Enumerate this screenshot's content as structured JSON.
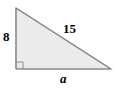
{
  "figure": {
    "kind": "right-triangle-diagram",
    "shape_name": "right triangle",
    "fill_color": "#ebebeb",
    "stroke_color": "#8c8c8c",
    "background_color": "#ffffff",
    "label_color": "#000000",
    "vertices": {
      "top_left": [
        16,
        8
      ],
      "bottom_left": [
        16,
        69
      ],
      "bottom_right": [
        111,
        69
      ]
    },
    "right_angle_marker": {
      "at_vertex": "bottom_left",
      "size": 7,
      "visible": true
    },
    "labels": {
      "vertical_leg": "8",
      "hypotenuse": "15",
      "horizontal_leg": "a"
    }
  }
}
